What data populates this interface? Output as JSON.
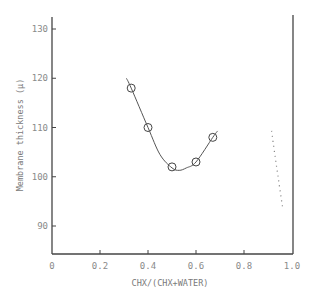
{
  "chart_data": {
    "type": "line",
    "title": "",
    "xlabel": "CHX/(CHX+WATER)",
    "ylabel": "Membrane thickness (μ)",
    "xlim": [
      0,
      1.0
    ],
    "ylim": [
      84.5,
      131.5
    ],
    "x_ticks": [
      0,
      0.2,
      0.4,
      0.6,
      0.8,
      1.0
    ],
    "x_tick_labels": [
      "0",
      "0.2",
      "0.4",
      "0.6",
      "0.8",
      "1.0"
    ],
    "y_ticks": [
      90,
      100,
      110,
      120,
      130
    ],
    "y_tick_labels": [
      "90",
      "100",
      "110",
      "120",
      "130"
    ],
    "grid": false,
    "legend": null,
    "series": [
      {
        "name": "measured",
        "style": "markers-circle",
        "x": [
          0.33,
          0.4,
          0.5,
          0.6,
          0.67
        ],
        "y": [
          118,
          110,
          102,
          103,
          108
        ]
      },
      {
        "name": "fitted curve",
        "style": "solid-line",
        "x": [
          0.31,
          0.33,
          0.4,
          0.45,
          0.5,
          0.53,
          0.56,
          0.6,
          0.67,
          0.69
        ],
        "y": [
          120,
          118,
          110,
          104.5,
          101.8,
          101.3,
          101.8,
          103,
          108,
          109.3
        ]
      },
      {
        "name": "dotted branch",
        "style": "dotted-line",
        "x": [
          0.915,
          0.93,
          0.945,
          0.96
        ],
        "y": [
          109.3,
          104,
          99,
          94
        ]
      }
    ]
  }
}
